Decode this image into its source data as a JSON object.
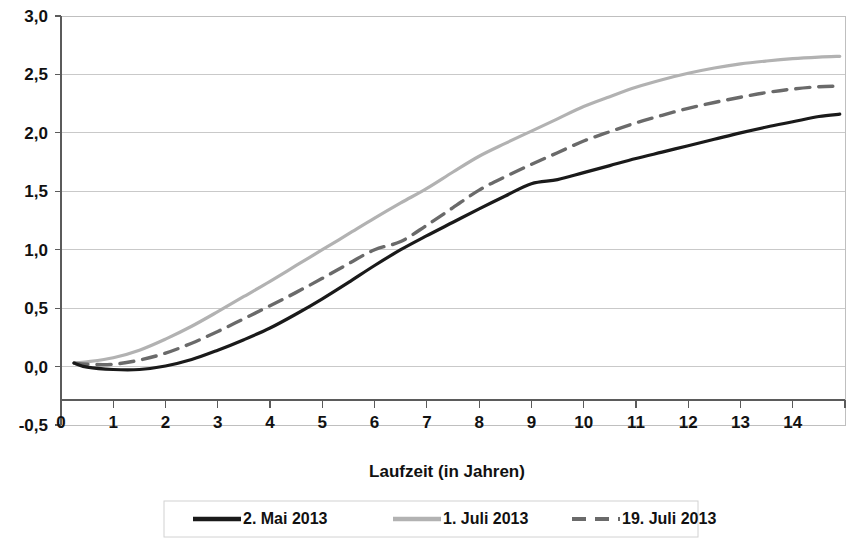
{
  "chart_data": {
    "type": "line",
    "title": "",
    "xlabel": "Laufzeit (in Jahren)",
    "ylabel": "",
    "xlim": [
      0,
      15
    ],
    "ylim": [
      -0.5,
      3.0
    ],
    "grid": true,
    "legend_position": "bottom",
    "x_ticks": [
      "0",
      "1",
      "2",
      "3",
      "4",
      "5",
      "6",
      "7",
      "8",
      "9",
      "10",
      "11",
      "12",
      "13",
      "14"
    ],
    "x_tick_values": [
      0,
      1,
      2,
      3,
      4,
      5,
      6,
      7,
      8,
      9,
      10,
      11,
      12,
      13,
      14
    ],
    "y_ticks": [
      "-0,5",
      "0,0",
      "0,5",
      "1,0",
      "1,5",
      "2,0",
      "2,5",
      "3,0"
    ],
    "y_tick_values": [
      -0.5,
      0.0,
      0.5,
      1.0,
      1.5,
      2.0,
      2.5,
      3.0
    ],
    "x": [
      0.25,
      0.5,
      1,
      1.5,
      2,
      2.5,
      3,
      3.5,
      4,
      4.5,
      5,
      5.5,
      6,
      6.5,
      7,
      7.5,
      8,
      8.5,
      9,
      9.5,
      10,
      10.5,
      11,
      11.5,
      12,
      12.5,
      13,
      13.5,
      14,
      14.5,
      14.9
    ],
    "series": [
      {
        "name": "2. Mai 2013",
        "color": "#1a1a1a",
        "style": "solid",
        "width": 3.2,
        "values": [
          0.03,
          -0.005,
          -0.025,
          -0.025,
          0.005,
          0.06,
          0.14,
          0.23,
          0.33,
          0.45,
          0.58,
          0.72,
          0.865,
          1.0,
          1.12,
          1.235,
          1.35,
          1.46,
          1.565,
          1.6,
          1.66,
          1.72,
          1.78,
          1.835,
          1.89,
          1.945,
          2.0,
          2.05,
          2.095,
          2.14,
          2.16
        ]
      },
      {
        "name": "1. Juli 2013",
        "color": "#b2b2b2",
        "style": "solid",
        "width": 3.2,
        "values": [
          0.03,
          0.04,
          0.075,
          0.14,
          0.235,
          0.345,
          0.47,
          0.6,
          0.73,
          0.865,
          1.0,
          1.135,
          1.27,
          1.4,
          1.525,
          1.665,
          1.8,
          1.91,
          2.015,
          2.12,
          2.225,
          2.31,
          2.39,
          2.455,
          2.51,
          2.555,
          2.59,
          2.615,
          2.635,
          2.648,
          2.655
        ]
      },
      {
        "name": "19. Juli 2013",
        "color": "#6a6a6a",
        "style": "dashed",
        "width": 3.4,
        "values": [
          0.03,
          0.02,
          0.02,
          0.055,
          0.115,
          0.2,
          0.3,
          0.41,
          0.52,
          0.635,
          0.755,
          0.88,
          1.0,
          1.07,
          1.21,
          1.36,
          1.51,
          1.625,
          1.73,
          1.83,
          1.93,
          2.01,
          2.085,
          2.15,
          2.21,
          2.26,
          2.305,
          2.345,
          2.375,
          2.395,
          2.4
        ]
      }
    ]
  },
  "legend": {
    "entries": [
      {
        "label": "2. Mai 2013"
      },
      {
        "label": "1. Juli 2013"
      },
      {
        "label": "19. Juli 2013"
      }
    ]
  },
  "axis": {
    "x_title": "Laufzeit (in Jahren)"
  }
}
